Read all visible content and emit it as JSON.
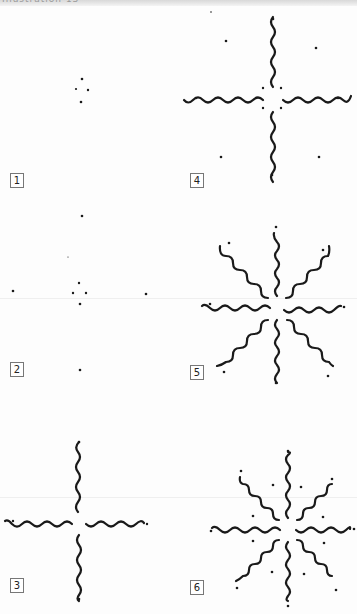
{
  "page": {
    "header": "Illustration 13",
    "ink_color": "#1a1a1a",
    "background": "#fdfdfd"
  },
  "steps": [
    {
      "number": "1",
      "description": "Four center dots marked in a small diamond"
    },
    {
      "number": "2",
      "description": "Four outer dots added at top, bottom, left, right"
    },
    {
      "number": "3",
      "description": "Four wavy lines drawn from center toward the outer dots"
    },
    {
      "number": "4",
      "description": "Eight more dots added: four near center, four diagonal outer"
    },
    {
      "number": "5",
      "description": "Four diagonal wavy lines added, forming eight-pointed star"
    },
    {
      "number": "6",
      "description": "Eight dots added between the rays"
    }
  ]
}
